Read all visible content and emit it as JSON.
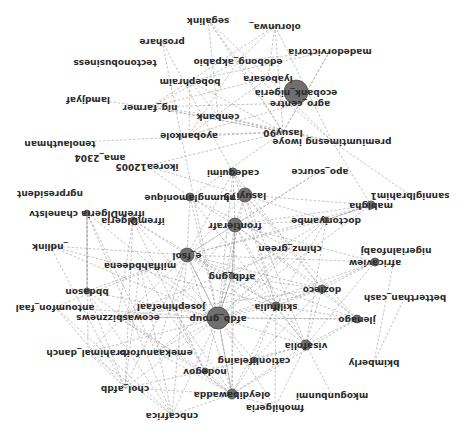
{
  "diagram": {
    "type": "network-graph",
    "orientation": "rotated-180",
    "colors": {
      "edge": "#9a9a9a",
      "node": "#6f6f6f",
      "label": "#2a2a2a",
      "background": "#ffffff"
    },
    "nodes": [
      {
        "id": "ecobank_nigeria",
        "label": "ecobank_nigeria",
        "x": 296,
        "y": 92,
        "r": 12
      },
      {
        "id": "olorunwa",
        "label": "olorunwa_",
        "x": 275,
        "y": 26,
        "r": 0
      },
      {
        "id": "segalink",
        "label": "segalink",
        "x": 208,
        "y": 20,
        "r": 0
      },
      {
        "id": "proshare",
        "label": "proshare",
        "x": 162,
        "y": 41,
        "r": 0
      },
      {
        "id": "madedorvictoria",
        "label": "madedorvictoria",
        "x": 330,
        "y": 51,
        "r": 0
      },
      {
        "id": "edobong_akpabio",
        "label": "edobong_akpabio",
        "x": 238,
        "y": 61,
        "r": 0
      },
      {
        "id": "tectonobusiness",
        "label": "tectonobusiness",
        "x": 115,
        "y": 62,
        "r": 0
      },
      {
        "id": "iyabosara",
        "label": "iyabosara",
        "x": 268,
        "y": 78,
        "r": 0
      },
      {
        "id": "bobephraim",
        "label": "bobephraim",
        "x": 190,
        "y": 81,
        "r": 0
      },
      {
        "id": "agro_centre",
        "label": "agro_centre",
        "x": 300,
        "y": 103,
        "r": 0
      },
      {
        "id": "lamdjyaf",
        "label": "lamdjyaf",
        "x": 88,
        "y": 99,
        "r": 0
      },
      {
        "id": "nig_farmer",
        "label": "nig_farmer",
        "x": 150,
        "y": 107,
        "r": 0
      },
      {
        "id": "cenbank",
        "label": "cenbank",
        "x": 218,
        "y": 116,
        "r": 0
      },
      {
        "id": "lasuy90",
        "label": "lasuy90",
        "x": 283,
        "y": 132,
        "r": 0
      },
      {
        "id": "premiumtimesng_iwoye",
        "label": "premiumtimesng iwoye",
        "x": 332,
        "y": 141,
        "r": 0
      },
      {
        "id": "ayobankole",
        "label": "ayobankole",
        "x": 189,
        "y": 135,
        "r": 0
      },
      {
        "id": "tenolauthman",
        "label": "tenolauthman",
        "x": 60,
        "y": 143,
        "r": 0
      },
      {
        "id": "ama_2304",
        "label": "ama_2304",
        "x": 100,
        "y": 157,
        "r": 0
      },
      {
        "id": "ikorea12005",
        "label": "ikorea12005",
        "x": 147,
        "y": 166,
        "r": 0
      },
      {
        "id": "apo_source",
        "label": "apo_source",
        "x": 320,
        "y": 171,
        "r": 0
      },
      {
        "id": "cadequimi",
        "label": "cadequimi",
        "x": 233,
        "y": 172,
        "r": 4
      },
      {
        "id": "sanniglbrahim1",
        "label": "sanniglbrahim1",
        "x": 410,
        "y": 195,
        "r": 0
      },
      {
        "id": "ngrpresident",
        "label": "ngrpresident",
        "x": 50,
        "y": 193,
        "r": 0
      },
      {
        "id": "lasuyi75",
        "label": "lasuyi75",
        "x": 245,
        "y": 195,
        "r": 7
      },
      {
        "id": "nlumngl_monique",
        "label": "nlumnglamonique",
        "x": 190,
        "y": 197,
        "r": 4
      },
      {
        "id": "mabigha",
        "label": "mabigha",
        "x": 371,
        "y": 205,
        "r": 4
      },
      {
        "id": "ifrem_chaneltv",
        "label": "ifremDlgeria chanelstv",
        "x": 87,
        "y": 213,
        "r": 3
      },
      {
        "id": "ifrem_nigeria",
        "label": "ifremDlgeria",
        "x": 133,
        "y": 220,
        "r": 3
      },
      {
        "id": "doctoriyambe",
        "label": "doctoriyambe",
        "x": 326,
        "y": 220,
        "r": 3
      },
      {
        "id": "frontierafr",
        "label": "frontierafr",
        "x": 235,
        "y": 225,
        "r": 7
      },
      {
        "id": "nigerialnfoabj",
        "label": "nigerialnfoabj",
        "x": 396,
        "y": 250,
        "r": 0
      },
      {
        "id": "chimz_green",
        "label": "chimz_green",
        "x": 290,
        "y": 248,
        "r": 0
      },
      {
        "id": "ndlink",
        "label": "_ndlink",
        "x": 50,
        "y": 246,
        "r": 0
      },
      {
        "id": "e_fsol",
        "label": "e_fsol",
        "x": 187,
        "y": 255,
        "r": 7
      },
      {
        "id": "africaview",
        "label": "africaview",
        "x": 375,
        "y": 262,
        "r": 4
      },
      {
        "id": "milflahbdeena",
        "label": "milflahbdeena",
        "x": 140,
        "y": 265,
        "r": 0
      },
      {
        "id": "afdb_gng",
        "label": "afdb_gng",
        "x": 232,
        "y": 276,
        "r": 3
      },
      {
        "id": "bbdason",
        "label": "bbdason",
        "x": 87,
        "y": 291,
        "r": 3
      },
      {
        "id": "dozieco",
        "label": "dozieco",
        "x": 322,
        "y": 289,
        "r": 4
      },
      {
        "id": "betterthan_cash",
        "label": "betterthan_cash",
        "x": 405,
        "y": 297,
        "r": 0
      },
      {
        "id": "afdb_group",
        "label": "afdb_group",
        "x": 218,
        "y": 318,
        "r": 11
      },
      {
        "id": "skillfulia",
        "label": "skillfulia",
        "x": 276,
        "y": 306,
        "r": 4
      },
      {
        "id": "jlenago",
        "label": "jlenago",
        "x": 357,
        "y": 319,
        "r": 4
      },
      {
        "id": "antoumfon_faal",
        "label": "antoumfon_faal",
        "x": 55,
        "y": 307,
        "r": 0
      },
      {
        "id": "josephinefaal",
        "label": "josephinefaal",
        "x": 171,
        "y": 306,
        "r": 0
      },
      {
        "id": "ecowasbizznews",
        "label": "ecowasbizznews",
        "x": 118,
        "y": 317,
        "r": 0
      },
      {
        "id": "visafolia",
        "label": "visafolia",
        "x": 306,
        "y": 345,
        "r": 5
      },
      {
        "id": "emekaanuforo",
        "label": "emekaanuforo",
        "x": 156,
        "y": 352,
        "r": 0
      },
      {
        "id": "ibrahimal_danch",
        "label": "ibrahimal_danch",
        "x": 88,
        "y": 352,
        "r": 0
      },
      {
        "id": "cationlifelaing",
        "label": "cationlifelaing",
        "x": 254,
        "y": 360,
        "r": 3
      },
      {
        "id": "bkimberly",
        "label": "bkimberly",
        "x": 374,
        "y": 362,
        "r": 0
      },
      {
        "id": "nodegov",
        "label": "nodegov",
        "x": 205,
        "y": 371,
        "r": 3
      },
      {
        "id": "chol_afdb",
        "label": "chol_afdb",
        "x": 125,
        "y": 388,
        "r": 0
      },
      {
        "id": "mkogunbunmi",
        "label": "mkogunbunmi",
        "x": 332,
        "y": 395,
        "r": 0
      },
      {
        "id": "fmohilgeria",
        "label": "fmohilgeria",
        "x": 275,
        "y": 407,
        "r": 0
      },
      {
        "id": "cnbcafrica",
        "label": "cnbcafrica",
        "x": 172,
        "y": 415,
        "r": 0
      },
      {
        "id": "oleydibawadda",
        "label": "oleydibawadda",
        "x": 232,
        "y": 394,
        "r": 5
      }
    ],
    "edges": [
      [
        "segalink",
        "edobong_akpabio"
      ],
      [
        "segalink",
        "lasuy90"
      ],
      [
        "segalink",
        "cenbank"
      ],
      [
        "segalink",
        "iyabosara"
      ],
      [
        "olorunwa",
        "bobephraim"
      ],
      [
        "olorunwa",
        "lasuy90"
      ],
      [
        "olorunwa",
        "iyabosara"
      ],
      [
        "olorunwa",
        "edobong_akpabio"
      ],
      [
        "olorunwa",
        "premiumtimesng_iwoye"
      ],
      [
        "proshare",
        "afdb_group"
      ],
      [
        "proshare",
        "lasuyi75"
      ],
      [
        "madedorvictoria",
        "edobong_akpabio"
      ],
      [
        "madedorvictoria",
        "agro_centre"
      ],
      [
        "madedorvictoria",
        "lasuy90"
      ],
      [
        "madedorvictoria",
        "bobephraim"
      ],
      [
        "edobong_akpabio",
        "nig_farmer"
      ],
      [
        "edobong_akpabio",
        "lasuy90"
      ],
      [
        "edobong_akpabio",
        "premiumtimesng_iwoye"
      ],
      [
        "edobong_akpabio",
        "ayobankole"
      ],
      [
        "bobephraim",
        "nig_farmer"
      ],
      [
        "bobephraim",
        "cenbank"
      ],
      [
        "bobephraim",
        "lasuy90"
      ],
      [
        "bobephraim",
        "ayobankole"
      ],
      [
        "iyabosara",
        "nig_farmer"
      ],
      [
        "iyabosara",
        "ayobankole"
      ],
      [
        "iyabosara",
        "premiumtimesng_iwoye"
      ],
      [
        "agro_centre",
        "ayobankole"
      ],
      [
        "agro_centre",
        "lasuy90"
      ],
      [
        "agro_centre",
        "nig_farmer"
      ],
      [
        "lamdjyaf",
        "nig_farmer"
      ],
      [
        "nig_farmer",
        "lasuy90"
      ],
      [
        "nig_farmer",
        "cenbank"
      ],
      [
        "nig_farmer",
        "premiumtimesng_iwoye"
      ],
      [
        "cenbank",
        "lasuy90"
      ],
      [
        "cenbank",
        "premiumtimesng_iwoye"
      ],
      [
        "ayobankole",
        "lasuy90"
      ],
      [
        "tenolauthman",
        "lasuy90"
      ],
      [
        "lasuy90",
        "nlumngl_monique"
      ],
      [
        "lasuy90",
        "ikorea12005"
      ],
      [
        "premiumtimesng_iwoye",
        "sanniglbrahim1"
      ],
      [
        "premiumtimesng_iwoye",
        "mabigha"
      ],
      [
        "ikorea12005",
        "doctoriyambe"
      ],
      [
        "ikorea12005",
        "nlumngl_monique"
      ],
      [
        "apo_source",
        "frontierafr"
      ],
      [
        "apo_source",
        "e_fsol"
      ],
      [
        "cadequimi",
        "afdb_group"
      ],
      [
        "cadequimi",
        "frontierafr"
      ],
      [
        "cadequimi",
        "skillfulia"
      ],
      [
        "cadequimi",
        "e_fsol"
      ],
      [
        "cadequimi",
        "dozieco"
      ],
      [
        "lasuyi75",
        "afdb_group"
      ],
      [
        "lasuyi75",
        "e_fsol"
      ],
      [
        "lasuyi75",
        "skillfulia"
      ],
      [
        "lasuyi75",
        "dozieco"
      ],
      [
        "lasuyi75",
        "jlenago"
      ],
      [
        "lasuyi75",
        "visafolia"
      ],
      [
        "lasuyi75",
        "mabigha"
      ],
      [
        "lasuyi75",
        "frontierafr"
      ],
      [
        "nlumngl_monique",
        "afdb_group"
      ],
      [
        "nlumngl_monique",
        "frontierafr"
      ],
      [
        "nlumngl_monique",
        "visafolia"
      ],
      [
        "nlumngl_monique",
        "e_fsol"
      ],
      [
        "nlumngl_monique",
        "chimz_green"
      ],
      [
        "mabigha",
        "doctoriyambe"
      ],
      [
        "mabigha",
        "frontierafr"
      ],
      [
        "mabigha",
        "afdb_group"
      ],
      [
        "mabigha",
        "e_fsol"
      ],
      [
        "ifrem_chaneltv",
        "afdb_group"
      ],
      [
        "ifrem_chaneltv",
        "bbdason"
      ],
      [
        "ifrem_chaneltv",
        "ibrahimal_danch"
      ],
      [
        "ifrem_chaneltv",
        "emekaanuforo"
      ],
      [
        "ifrem_chaneltv",
        "cnbcafrica"
      ],
      [
        "ifrem_nigeria",
        "afdb_group"
      ],
      [
        "ifrem_nigeria",
        "chol_afdb"
      ],
      [
        "ifrem_nigeria",
        "ecowasbizznews"
      ],
      [
        "ifrem_nigeria",
        "e_fsol"
      ],
      [
        "ifrem_nigeria",
        "nodegov"
      ],
      [
        "ifrem_nigeria",
        "skillfulia"
      ],
      [
        "doctoriyambe",
        "afdb_group"
      ],
      [
        "doctoriyambe",
        "frontierafr"
      ],
      [
        "doctoriyambe",
        "e_fsol"
      ],
      [
        "doctoriyambe",
        "afdb_gng"
      ],
      [
        "doctoriyambe",
        "skillfulia"
      ],
      [
        "doctoriyambe",
        "visafolia"
      ],
      [
        "frontierafr",
        "afdb_group"
      ],
      [
        "frontierafr",
        "e_fsol"
      ],
      [
        "frontierafr",
        "afdb_gng"
      ],
      [
        "frontierafr",
        "skillfulia"
      ],
      [
        "frontierafr",
        "dozieco"
      ],
      [
        "frontierafr",
        "jlenago"
      ],
      [
        "frontierafr",
        "visafolia"
      ],
      [
        "frontierafr",
        "oleydibawadda"
      ],
      [
        "frontierafr",
        "josephinefaal"
      ],
      [
        "nigerialnfoabj",
        "bkimberly"
      ],
      [
        "chimz_green",
        "afdb_group"
      ],
      [
        "chimz_green",
        "ecowasbizznews"
      ],
      [
        "chimz_green",
        "emekaanuforo"
      ],
      [
        "ndlink",
        "e_fsol"
      ],
      [
        "ndlink",
        "afdb_group"
      ],
      [
        "ndlink",
        "chol_afdb"
      ],
      [
        "ndlink",
        "skillfulia"
      ],
      [
        "e_fsol",
        "afdb_group"
      ],
      [
        "e_fsol",
        "afdb_gng"
      ],
      [
        "e_fsol",
        "bbdason"
      ],
      [
        "e_fsol",
        "dozieco"
      ],
      [
        "e_fsol",
        "skillfulia"
      ],
      [
        "e_fsol",
        "jlenago"
      ],
      [
        "e_fsol",
        "antoumfon_faal"
      ],
      [
        "e_fsol",
        "ibrahimal_danch"
      ],
      [
        "e_fsol",
        "emekaanuforo"
      ],
      [
        "e_fsol",
        "chol_afdb"
      ],
      [
        "e_fsol",
        "cnbcafrica"
      ],
      [
        "e_fsol",
        "oleydibawadda"
      ],
      [
        "e_fsol",
        "visafolia"
      ],
      [
        "africaview",
        "afdb_group"
      ],
      [
        "africaview",
        "dozieco"
      ],
      [
        "africaview",
        "skillfulia"
      ],
      [
        "africaview",
        "e_fsol"
      ],
      [
        "africaview",
        "frontierafr"
      ],
      [
        "africaview",
        "visafolia"
      ],
      [
        "milflahbdeena",
        "afdb_group"
      ],
      [
        "milflahbdeena",
        "cnbcafrica"
      ],
      [
        "milflahbdeena",
        "chol_afdb"
      ],
      [
        "milflahbdeena",
        "nodegov"
      ],
      [
        "afdb_gng",
        "afdb_group"
      ],
      [
        "afdb_gng",
        "skillfulia"
      ],
      [
        "afdb_gng",
        "dozieco"
      ],
      [
        "afdb_gng",
        "oleydibawadda"
      ],
      [
        "bbdason",
        "afdb_group"
      ],
      [
        "bbdason",
        "chol_afdb"
      ],
      [
        "bbdason",
        "cnbcafrica"
      ],
      [
        "bbdason",
        "oleydibawadda"
      ],
      [
        "dozieco",
        "afdb_group"
      ],
      [
        "dozieco",
        "skillfulia"
      ],
      [
        "dozieco",
        "jlenago"
      ],
      [
        "dozieco",
        "visafolia"
      ],
      [
        "dozieco",
        "cationlifelaing"
      ],
      [
        "dozieco",
        "ecowasbizznews"
      ],
      [
        "afdb_group",
        "skillfulia"
      ],
      [
        "afdb_group",
        "jlenago"
      ],
      [
        "afdb_group",
        "josephinefaal"
      ],
      [
        "afdb_group",
        "ecowasbizznews"
      ],
      [
        "afdb_group",
        "antoumfon_faal"
      ],
      [
        "afdb_group",
        "visafolia"
      ],
      [
        "afdb_group",
        "emekaanuforo"
      ],
      [
        "afdb_group",
        "ibrahimal_danch"
      ],
      [
        "afdb_group",
        "cationlifelaing"
      ],
      [
        "afdb_group",
        "nodegov"
      ],
      [
        "afdb_group",
        "chol_afdb"
      ],
      [
        "afdb_group",
        "cnbcafrica"
      ],
      [
        "afdb_group",
        "oleydibawadda"
      ],
      [
        "afdb_group",
        "fmohilgeria"
      ],
      [
        "skillfulia",
        "jlenago"
      ],
      [
        "skillfulia",
        "visafolia"
      ],
      [
        "skillfulia",
        "cationlifelaing"
      ],
      [
        "skillfulia",
        "oleydibawadda"
      ],
      [
        "skillfulia",
        "fmohilgeria"
      ],
      [
        "jlenago",
        "visafolia"
      ],
      [
        "jlenago",
        "ecowasbizznews"
      ],
      [
        "jlenago",
        "oleydibawadda"
      ],
      [
        "antoumfon_faal",
        "chol_afdb"
      ],
      [
        "antoumfon_faal",
        "cnbcafrica"
      ],
      [
        "josephinefaal",
        "oleydibawadda"
      ],
      [
        "josephinefaal",
        "nodegov"
      ],
      [
        "ecowasbizznews",
        "nodegov"
      ],
      [
        "ecowasbizznews",
        "oleydibawadda"
      ],
      [
        "visafolia",
        "mkogunbunmi"
      ],
      [
        "visafolia",
        "cationlifelaing"
      ],
      [
        "visafolia",
        "fmohilgeria"
      ],
      [
        "visafolia",
        "oleydibawadda"
      ],
      [
        "visafolia",
        "nodegov"
      ],
      [
        "emekaanuforo",
        "oleydibawadda"
      ],
      [
        "ibrahimal_danch",
        "cnbcafrica"
      ],
      [
        "ibrahimal_danch",
        "chol_afdb"
      ],
      [
        "cationlifelaing",
        "oleydibawadda"
      ],
      [
        "nodegov",
        "oleydibawadda"
      ],
      [
        "chol_afdb",
        "oleydibawadda"
      ],
      [
        "chol_afdb",
        "nodegov"
      ],
      [
        "fmohilgeria",
        "oleydibawadda"
      ],
      [
        "cnbcafrica",
        "oleydibawadda"
      ],
      [
        "bkimberly",
        "betterthan_cash"
      ]
    ],
    "solid_edges": [
      [
        "afdb_gng",
        "frontierafr"
      ],
      [
        "afdb_gng",
        "afdb_group"
      ],
      [
        "e_fsol",
        "afdb_group"
      ],
      [
        "doctoriyambe",
        "mabigha"
      ],
      [
        "oleydibawadda",
        "afdb_group"
      ],
      [
        "bbdason",
        "ifrem_chaneltv"
      ]
    ]
  }
}
